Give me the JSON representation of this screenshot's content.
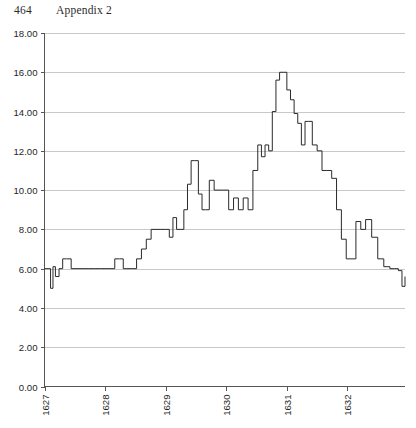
{
  "header": {
    "folio": "464",
    "title": "Appendix 2"
  },
  "chart_data": {
    "type": "line",
    "title": "",
    "subtitle": "",
    "xlabel": "",
    "ylabel": "",
    "grid": "horizontal",
    "legend": "none",
    "ylim": [
      0.0,
      18.0
    ],
    "ytick_step": 2.0,
    "ytick_labels": [
      "18.00",
      "16.00",
      "14.00",
      "12.00",
      "10.00",
      "8.00",
      "6.00",
      "4.00",
      "2.00",
      "0.00"
    ],
    "ytick_values": [
      18.0,
      16.0,
      14.0,
      12.0,
      10.0,
      8.0,
      6.0,
      4.0,
      2.0,
      0.0
    ],
    "xtick_labels": [
      "1627",
      "1628",
      "1629",
      "1630",
      "1631",
      "1632"
    ],
    "xtick_values": [
      1627,
      1628,
      1629,
      1630,
      1631,
      1632
    ],
    "xlim": [
      1627.0,
      1632.95
    ],
    "xlabel_rotation": -90,
    "series": [
      {
        "name": "series-1",
        "style": "step",
        "color": "#2a2a2a",
        "x": [
          1627.0,
          1627.06,
          1627.1,
          1627.14,
          1627.18,
          1627.24,
          1627.3,
          1627.36,
          1627.44,
          1627.52,
          1627.62,
          1627.72,
          1627.82,
          1627.92,
          1628.0,
          1628.08,
          1628.16,
          1628.24,
          1628.3,
          1628.36,
          1628.44,
          1628.52,
          1628.6,
          1628.68,
          1628.76,
          1628.84,
          1628.92,
          1629.0,
          1629.06,
          1629.12,
          1629.18,
          1629.24,
          1629.3,
          1629.36,
          1629.42,
          1629.48,
          1629.54,
          1629.6,
          1629.66,
          1629.72,
          1629.8,
          1629.88,
          1629.96,
          1630.04,
          1630.12,
          1630.2,
          1630.28,
          1630.36,
          1630.44,
          1630.52,
          1630.58,
          1630.64,
          1630.7,
          1630.76,
          1630.82,
          1630.88,
          1630.94,
          1631.0,
          1631.06,
          1631.12,
          1631.18,
          1631.24,
          1631.3,
          1631.36,
          1631.42,
          1631.5,
          1631.58,
          1631.66,
          1631.74,
          1631.82,
          1631.9,
          1631.98,
          1632.06,
          1632.14,
          1632.22,
          1632.3,
          1632.4,
          1632.5,
          1632.6,
          1632.7,
          1632.78,
          1632.84,
          1632.9,
          1632.95
        ],
        "values": [
          6.0,
          6.0,
          5.0,
          6.1,
          5.6,
          6.0,
          6.5,
          6.5,
          6.0,
          6.0,
          6.0,
          6.0,
          6.0,
          6.0,
          6.0,
          6.0,
          6.5,
          6.5,
          6.0,
          6.0,
          6.0,
          6.5,
          7.0,
          7.5,
          8.0,
          8.0,
          8.0,
          8.0,
          7.6,
          8.6,
          8.0,
          8.0,
          9.0,
          10.3,
          11.5,
          11.5,
          9.8,
          9.0,
          9.0,
          10.5,
          10.0,
          10.0,
          10.0,
          9.0,
          9.6,
          9.0,
          9.6,
          9.0,
          11.0,
          12.3,
          11.7,
          12.3,
          12.0,
          14.0,
          15.6,
          16.0,
          16.0,
          15.1,
          14.6,
          13.9,
          13.4,
          12.3,
          13.5,
          13.5,
          12.3,
          12.0,
          11.0,
          11.0,
          10.6,
          9.0,
          7.5,
          6.5,
          6.5,
          8.4,
          8.0,
          8.5,
          7.6,
          6.5,
          6.1,
          6.0,
          6.0,
          5.9,
          5.1,
          5.6
        ]
      }
    ],
    "peak": {
      "x": 1630.94,
      "y": 16.0
    },
    "minimum": {
      "x": 1627.1,
      "y": 5.0
    }
  }
}
